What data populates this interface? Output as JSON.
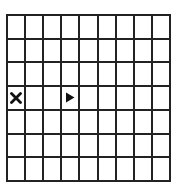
{
  "grid": {
    "columns": 9,
    "rows": 7,
    "line_color": "#222222",
    "background": "#ffffff"
  },
  "markers": [
    {
      "type": "x",
      "icon": "x-mark-icon",
      "row": 3,
      "col": 0,
      "color": "#111111"
    },
    {
      "type": "player-triangle",
      "icon": "triangle-right-icon",
      "row": 3,
      "col": 3,
      "direction": "right",
      "color": "#111111"
    }
  ]
}
